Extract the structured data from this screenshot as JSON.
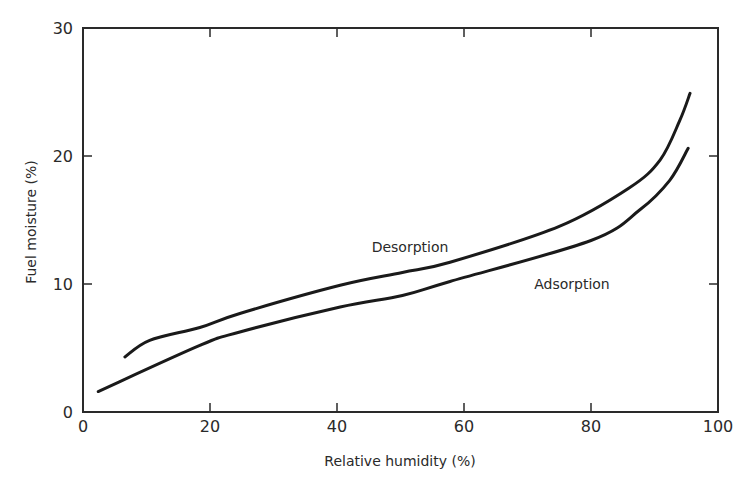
{
  "chart_data": {
    "type": "line",
    "title": "",
    "xlabel": "Relative humidity (%)",
    "ylabel": "Fuel moisture (%)",
    "xlim": [
      0,
      100
    ],
    "ylim": [
      0,
      30
    ],
    "xticks": [
      0,
      20,
      40,
      60,
      80,
      100
    ],
    "yticks": [
      0,
      10,
      20,
      30
    ],
    "grid": false,
    "legend": "none (inline curve labels)",
    "series": [
      {
        "name": "Desorption",
        "label_pos": [
          51.5,
          12.5
        ],
        "x": [
          6.6,
          10.5,
          18.4,
          24.7,
          40.5,
          50.3,
          57.8,
          75,
          86,
          90.9,
          94,
          95.6
        ],
        "y": [
          4.3,
          5.6,
          6.6,
          7.7,
          9.9,
          10.9,
          11.7,
          14.5,
          17.5,
          19.7,
          22.8,
          24.9
        ]
      },
      {
        "name": "Adsorption",
        "label_pos": [
          77,
          9.6
        ],
        "x": [
          2.4,
          18.4,
          24.7,
          40.5,
          50.3,
          57.8,
          80,
          87.7,
          92.4,
          95.3
        ],
        "y": [
          1.6,
          5.2,
          6.25,
          8.2,
          9.1,
          10.2,
          13.4,
          15.8,
          18.1,
          20.6
        ]
      }
    ]
  },
  "colors": {
    "line": "#1a1a1a",
    "axis": "#2a2a2a",
    "background": "#ffffff"
  }
}
